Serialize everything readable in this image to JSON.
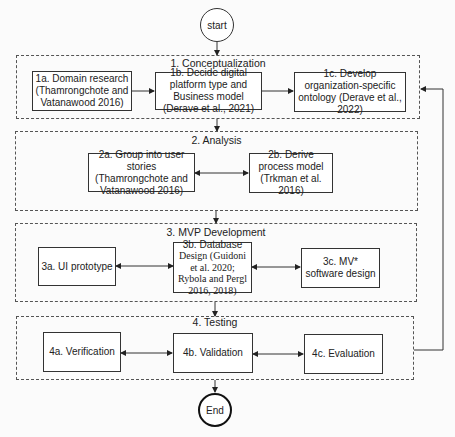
{
  "diagram": {
    "start": {
      "label": "start"
    },
    "end": {
      "label": "End"
    },
    "phases": [
      {
        "title": "1. Conceptualization",
        "nodes": [
          {
            "id": "1a",
            "label": "1a. Domain research (Thamrongchote and Vatanawood 2016)"
          },
          {
            "id": "1b",
            "label": "1b. Decide digital platform type and Business model (Derave et al., 2021)"
          },
          {
            "id": "1c",
            "label": "1c. Develop  organization-specific ontology (Derave et al., 2022)"
          }
        ]
      },
      {
        "title": "2. Analysis",
        "nodes": [
          {
            "id": "2a",
            "label": "2a. Group into user stories (Thamrongchote and Vatanawood 2016)"
          },
          {
            "id": "2b",
            "label": "2b. Derive  process model (Trkman et al. 2016)"
          }
        ]
      },
      {
        "title": "3. MVP Development",
        "nodes": [
          {
            "id": "3a",
            "label": "3a. UI prototype"
          },
          {
            "id": "3b",
            "label_head": "3b. Database",
            "label_rest": "Design (Guidoni et al. 2020; Rybola and Pergl 2016, 2018)"
          },
          {
            "id": "3c",
            "label": "3c. MV* software design"
          }
        ]
      },
      {
        "title": "4. Testing",
        "nodes": [
          {
            "id": "4a",
            "label": "4a. Verification"
          },
          {
            "id": "4b",
            "label": "4b. Validation"
          },
          {
            "id": "4c",
            "label": "4c. Evaluation"
          }
        ]
      }
    ],
    "edges": [
      {
        "from": "start",
        "to": "phase-1",
        "type": "directed"
      },
      {
        "from": "1a",
        "to": "1b",
        "type": "directed"
      },
      {
        "from": "1b",
        "to": "1c",
        "type": "directed"
      },
      {
        "from": "phase-1",
        "to": "phase-2",
        "type": "directed"
      },
      {
        "from": "2a",
        "to": "2b",
        "type": "bidirectional"
      },
      {
        "from": "phase-2",
        "to": "phase-3",
        "type": "directed"
      },
      {
        "from": "3a",
        "to": "3b",
        "type": "bidirectional"
      },
      {
        "from": "3b",
        "to": "3c",
        "type": "bidirectional"
      },
      {
        "from": "phase-3",
        "to": "phase-4",
        "type": "directed"
      },
      {
        "from": "4a",
        "to": "4b",
        "type": "bidirectional"
      },
      {
        "from": "4b",
        "to": "4c",
        "type": "bidirectional"
      },
      {
        "from": "phase-4",
        "to": "end",
        "type": "directed"
      },
      {
        "from": "phase-4",
        "to": "phase-1",
        "type": "feedback"
      }
    ],
    "colors": {
      "line": "#333333",
      "background": "#fbfbfb"
    }
  }
}
